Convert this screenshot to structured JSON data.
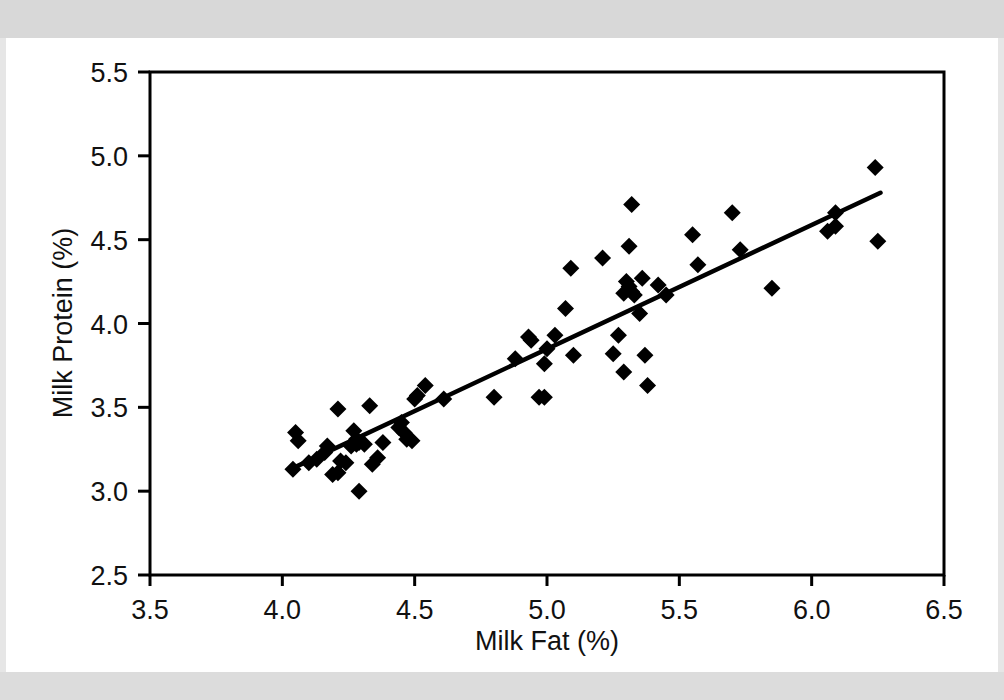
{
  "chart_data": {
    "type": "scatter",
    "title": "",
    "xlabel": "Milk Fat (%)",
    "ylabel": "Milk Protein (%)",
    "xlim": [
      3.5,
      6.5
    ],
    "ylim": [
      2.5,
      5.5
    ],
    "xticks": [
      "3.5",
      "4.0",
      "4.5",
      "5.0",
      "5.5",
      "6.0",
      "6.5"
    ],
    "xtick_values": [
      3.5,
      4.0,
      4.5,
      5.0,
      5.5,
      6.0,
      6.5
    ],
    "yticks": [
      "2.5",
      "3.0",
      "3.5",
      "4.0",
      "4.5",
      "5.0",
      "5.5"
    ],
    "ytick_values": [
      2.5,
      3.0,
      3.5,
      4.0,
      4.5,
      5.0,
      5.5
    ],
    "grid": false,
    "legend": "none",
    "marker": "diamond",
    "marker_color": "#000000",
    "frame_color": "#000000",
    "background": "#ffffff",
    "trendline": {
      "label": "linear regression",
      "color": "#000000",
      "x_start": 4.03,
      "y_start": 3.13,
      "x_end": 6.26,
      "y_end": 4.78
    },
    "points": [
      [
        4.05,
        3.35
      ],
      [
        4.06,
        3.3
      ],
      [
        4.04,
        3.13
      ],
      [
        4.1,
        3.17
      ],
      [
        4.13,
        3.19
      ],
      [
        4.16,
        3.23
      ],
      [
        4.17,
        3.27
      ],
      [
        4.19,
        3.1
      ],
      [
        4.21,
        3.11
      ],
      [
        4.21,
        3.49
      ],
      [
        4.22,
        3.18
      ],
      [
        4.24,
        3.17
      ],
      [
        4.26,
        3.27
      ],
      [
        4.27,
        3.36
      ],
      [
        4.28,
        3.31
      ],
      [
        4.28,
        3.28
      ],
      [
        4.29,
        3.29
      ],
      [
        4.29,
        3.0
      ],
      [
        4.31,
        3.28
      ],
      [
        4.33,
        3.51
      ],
      [
        4.34,
        3.16
      ],
      [
        4.36,
        3.2
      ],
      [
        4.38,
        3.29
      ],
      [
        4.44,
        3.38
      ],
      [
        4.45,
        3.41
      ],
      [
        4.46,
        3.35
      ],
      [
        4.47,
        3.31
      ],
      [
        4.49,
        3.3
      ],
      [
        4.5,
        3.55
      ],
      [
        4.51,
        3.57
      ],
      [
        4.54,
        3.63
      ],
      [
        4.61,
        3.55
      ],
      [
        4.8,
        3.56
      ],
      [
        4.88,
        3.79
      ],
      [
        4.93,
        3.92
      ],
      [
        4.94,
        3.9
      ],
      [
        4.97,
        3.56
      ],
      [
        4.99,
        3.56
      ],
      [
        4.99,
        3.76
      ],
      [
        5.0,
        3.85
      ],
      [
        5.03,
        3.93
      ],
      [
        5.07,
        4.09
      ],
      [
        5.09,
        4.33
      ],
      [
        5.1,
        3.81
      ],
      [
        5.21,
        4.39
      ],
      [
        5.25,
        3.82
      ],
      [
        5.27,
        3.93
      ],
      [
        5.29,
        4.18
      ],
      [
        5.29,
        3.71
      ],
      [
        5.3,
        4.25
      ],
      [
        5.31,
        4.22
      ],
      [
        5.31,
        4.46
      ],
      [
        5.32,
        4.19
      ],
      [
        5.32,
        4.71
      ],
      [
        5.33,
        4.17
      ],
      [
        5.35,
        4.06
      ],
      [
        5.36,
        4.27
      ],
      [
        5.37,
        3.81
      ],
      [
        5.38,
        3.63
      ],
      [
        5.42,
        4.23
      ],
      [
        5.45,
        4.17
      ],
      [
        5.55,
        4.53
      ],
      [
        5.57,
        4.35
      ],
      [
        5.7,
        4.66
      ],
      [
        5.73,
        4.44
      ],
      [
        5.85,
        4.21
      ],
      [
        6.06,
        4.55
      ],
      [
        6.09,
        4.58
      ],
      [
        6.09,
        4.66
      ],
      [
        6.24,
        4.93
      ],
      [
        6.25,
        4.49
      ]
    ]
  }
}
